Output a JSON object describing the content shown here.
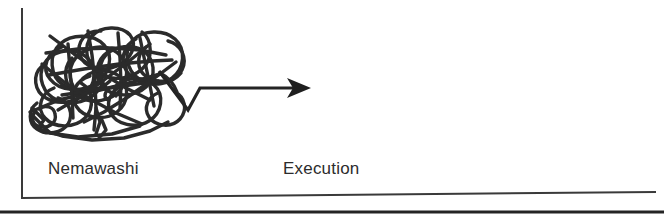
{
  "figure": {
    "kind": "hand-drawn-timeline-diagram",
    "background_color": "#ffffff",
    "ink_color": "#2b2b2b",
    "phases": [
      {
        "id": "nemawashi",
        "label": "Nemawashi"
      },
      {
        "id": "execution",
        "label": "Execution"
      }
    ],
    "axes": {
      "y_axis": {
        "name": "vertical-axis",
        "visible": true
      },
      "x_axis": {
        "name": "horizontal-axis",
        "visible": true
      }
    },
    "marks": {
      "scribble": {
        "name": "tangled-scribble",
        "meaning": "messy consensus-building loops"
      },
      "arrow": {
        "name": "straight-arrow",
        "meaning": "swift straight-line execution"
      }
    },
    "bottom_rule": {
      "name": "bottom-border-rule",
      "visible": true
    }
  }
}
